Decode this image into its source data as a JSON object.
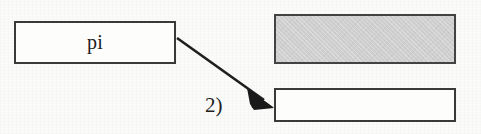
{
  "canvas": {
    "width": 481,
    "height": 134,
    "background_color": "#fbfbf9"
  },
  "diagram": {
    "title": "",
    "nodes": [
      {
        "id": "box-pi",
        "label": "pi",
        "shape": "rectangle",
        "fill_color": "#fdfdfc",
        "border_color": "#3a3a3a",
        "x": 14,
        "y": 21,
        "width": 162,
        "height": 43
      },
      {
        "id": "box-gray",
        "label": "",
        "shape": "rectangle",
        "fill_color": "#cfcfcf",
        "border_color": "#434343",
        "x": 274,
        "y": 14,
        "width": 182,
        "height": 50
      },
      {
        "id": "box-empty",
        "label": "",
        "shape": "rectangle",
        "fill_color": "#fdfdfc",
        "border_color": "#3a3a3a",
        "x": 274,
        "y": 88,
        "width": 182,
        "height": 34
      }
    ],
    "edges": [
      {
        "id": "edge-pi-to-empty",
        "label": "2)",
        "from": "box-pi",
        "to": "box-empty",
        "start_x": 177,
        "start_y": 38,
        "end_x": 274,
        "end_y": 107,
        "color": "#1f1f1f",
        "arrowhead": "filled-triangle"
      }
    ]
  }
}
